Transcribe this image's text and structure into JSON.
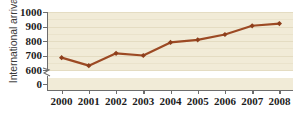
{
  "chart_data": {
    "type": "line",
    "title": "",
    "xlabel": "",
    "ylabel": "International arrivals",
    "categories": [
      "2000",
      "2001",
      "2002",
      "2003",
      "2004",
      "2005",
      "2006",
      "2007",
      "2008"
    ],
    "values": [
      685,
      630,
      715,
      700,
      790,
      808,
      845,
      905,
      920
    ],
    "series": [
      {
        "name": "International arrivals",
        "values": [
          685,
          630,
          715,
          700,
          790,
          808,
          845,
          905,
          920
        ]
      }
    ],
    "ylim": [
      600,
      1000
    ],
    "yticks": [
      "1000",
      "900",
      "800",
      "700",
      "600",
      "0"
    ],
    "ytick_values": [
      1000,
      900,
      800,
      700,
      600,
      0
    ],
    "axis_break": true,
    "axis_break_between": [
      0,
      600
    ],
    "grid": true,
    "legend": "none",
    "marker": "diamond",
    "colors": {
      "line": "#9c4a24",
      "marker": "#8e3f1c",
      "plot_background": "#f1ebd7",
      "gridline": "#e4dcc2",
      "axis": "#6d6d6d",
      "text": "#1d1d1d",
      "page_background": "#ffffff"
    }
  }
}
